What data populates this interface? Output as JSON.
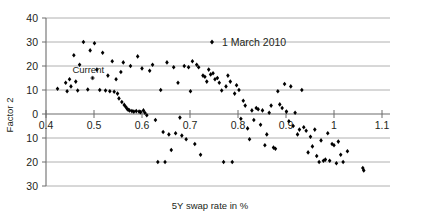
{
  "chart_data": {
    "type": "scatter",
    "title": "",
    "xlabel": "5Y swap rate in %",
    "ylabel": "Factor 2",
    "xlim": [
      0.4,
      1.1
    ],
    "ylim": [
      -30,
      40
    ],
    "xticks": [
      0.4,
      0.5,
      0.6,
      0.7,
      0.8,
      0.9,
      1.0,
      1.1
    ],
    "xtick_labels": [
      "0.4",
      "0.5",
      "0.6",
      "0.7",
      "0.8",
      "0.9",
      "1",
      "1.1"
    ],
    "yticks": [
      40,
      30,
      20,
      10,
      0,
      -10,
      -20,
      -30
    ],
    "ytick_labels": [
      "40",
      "30",
      "20",
      "10",
      "0",
      "10",
      "20",
      "30"
    ],
    "grid": true,
    "legend": {
      "position": "top-center",
      "entries": [
        {
          "label": "1 March 2010",
          "marker": "diamond",
          "color": "#000000"
        }
      ]
    },
    "annotations": [
      {
        "text": "Current",
        "x": 0.455,
        "y": 18.5,
        "marker_x": 0.497,
        "marker_y": 15.0
      }
    ],
    "series": [
      {
        "name": "1 March 2010",
        "marker": "diamond",
        "color": "#000000",
        "points": [
          [
            0.424,
            10.5
          ],
          [
            0.441,
            13.0
          ],
          [
            0.444,
            9.5
          ],
          [
            0.449,
            14.5
          ],
          [
            0.452,
            11.5
          ],
          [
            0.458,
            24.5
          ],
          [
            0.462,
            13.5
          ],
          [
            0.466,
            9.8
          ],
          [
            0.47,
            20.5
          ],
          [
            0.478,
            30.0
          ],
          [
            0.487,
            10.2
          ],
          [
            0.492,
            26.5
          ],
          [
            0.497,
            15.0
          ],
          [
            0.501,
            29.5
          ],
          [
            0.506,
            18.5
          ],
          [
            0.512,
            10.0
          ],
          [
            0.518,
            25.5
          ],
          [
            0.524,
            9.8
          ],
          [
            0.529,
            16.0
          ],
          [
            0.533,
            9.5
          ],
          [
            0.538,
            22.0
          ],
          [
            0.542,
            9.3
          ],
          [
            0.546,
            14.5
          ],
          [
            0.549,
            8.5
          ],
          [
            0.552,
            6.5
          ],
          [
            0.556,
            17.5
          ],
          [
            0.558,
            5.0
          ],
          [
            0.561,
            21.5
          ],
          [
            0.563,
            3.8
          ],
          [
            0.566,
            3.0
          ],
          [
            0.569,
            2.2
          ],
          [
            0.571,
            1.8
          ],
          [
            0.574,
            1.5
          ],
          [
            0.576,
            20.0
          ],
          [
            0.579,
            1.2
          ],
          [
            0.583,
            1.0
          ],
          [
            0.588,
            1.2
          ],
          [
            0.591,
            24.0
          ],
          [
            0.594,
            1.0
          ],
          [
            0.597,
            0.8
          ],
          [
            0.6,
            19.0
          ],
          [
            0.603,
            1.5
          ],
          [
            0.606,
            0.5
          ],
          [
            0.61,
            -0.5
          ],
          [
            0.616,
            18.0
          ],
          [
            0.622,
            20.5
          ],
          [
            0.628,
            -2.5
          ],
          [
            0.633,
            -20.0
          ],
          [
            0.639,
            10.0
          ],
          [
            0.644,
            -7.5
          ],
          [
            0.648,
            -20.0
          ],
          [
            0.652,
            21.5
          ],
          [
            0.656,
            -8.5
          ],
          [
            0.661,
            -15.0
          ],
          [
            0.666,
            19.5
          ],
          [
            0.67,
            -8.0
          ],
          [
            0.675,
            13.0
          ],
          [
            0.679,
            -1.5
          ],
          [
            0.683,
            -9.0
          ],
          [
            0.688,
            20.0
          ],
          [
            0.692,
            -10.5
          ],
          [
            0.697,
            19.5
          ],
          [
            0.701,
            9.5
          ],
          [
            0.705,
            22.0
          ],
          [
            0.71,
            -12.5
          ],
          [
            0.714,
            20.5
          ],
          [
            0.718,
            19.5
          ],
          [
            0.722,
            -17.0
          ],
          [
            0.727,
            16.0
          ],
          [
            0.731,
            15.5
          ],
          [
            0.735,
            13.5
          ],
          [
            0.739,
            18.5
          ],
          [
            0.743,
            16.5
          ],
          [
            0.748,
            17.0
          ],
          [
            0.752,
            14.5
          ],
          [
            0.757,
            15.0
          ],
          [
            0.761,
            13.0
          ],
          [
            0.766,
            9.8
          ],
          [
            0.77,
            -20.0
          ],
          [
            0.775,
            11.5
          ],
          [
            0.779,
            16.0
          ],
          [
            0.784,
            13.5
          ],
          [
            0.788,
            -20.0
          ],
          [
            0.793,
            8.5
          ],
          [
            0.797,
            12.0
          ],
          [
            0.802,
            10.0
          ],
          [
            0.806,
            -2.0
          ],
          [
            0.811,
            5.5
          ],
          [
            0.815,
            3.5
          ],
          [
            0.82,
            -6.0
          ],
          [
            0.824,
            -10.5
          ],
          [
            0.829,
            1.5
          ],
          [
            0.833,
            -2.5
          ],
          [
            0.838,
            2.5
          ],
          [
            0.842,
            2.0
          ],
          [
            0.847,
            -4.5
          ],
          [
            0.851,
            1.5
          ],
          [
            0.856,
            -13.0
          ],
          [
            0.86,
            -8.5
          ],
          [
            0.865,
            0.5
          ],
          [
            0.869,
            3.5
          ],
          [
            0.874,
            -14.0
          ],
          [
            0.878,
            -14.5
          ],
          [
            0.883,
            9.5
          ],
          [
            0.887,
            4.0
          ],
          [
            0.892,
            2.5
          ],
          [
            0.897,
            12.5
          ],
          [
            0.901,
            1.0
          ],
          [
            0.906,
            -3.0
          ],
          [
            0.91,
            11.5
          ],
          [
            0.915,
            -5.0
          ],
          [
            0.919,
            0.5
          ],
          [
            0.924,
            -8.5
          ],
          [
            0.928,
            -6.5
          ],
          [
            0.933,
            10.0
          ],
          [
            0.937,
            -5.5
          ],
          [
            0.942,
            -7.0
          ],
          [
            0.946,
            -16.0
          ],
          [
            0.951,
            -9.5
          ],
          [
            0.955,
            -13.5
          ],
          [
            0.96,
            -6.5
          ],
          [
            0.964,
            -17.5
          ],
          [
            0.969,
            -20.0
          ],
          [
            0.973,
            -11.0
          ],
          [
            0.978,
            -19.5
          ],
          [
            0.982,
            -19.0
          ],
          [
            0.987,
            -8.0
          ],
          [
            0.991,
            -19.5
          ],
          [
            0.996,
            -12.5
          ],
          [
            1.0,
            -13.0
          ],
          [
            1.005,
            -20.5
          ],
          [
            1.009,
            -11.5
          ],
          [
            1.014,
            -17.0
          ],
          [
            1.019,
            -20.0
          ],
          [
            1.028,
            -15.5
          ],
          [
            1.06,
            -22.5
          ],
          [
            1.062,
            -23.5
          ]
        ]
      }
    ]
  }
}
